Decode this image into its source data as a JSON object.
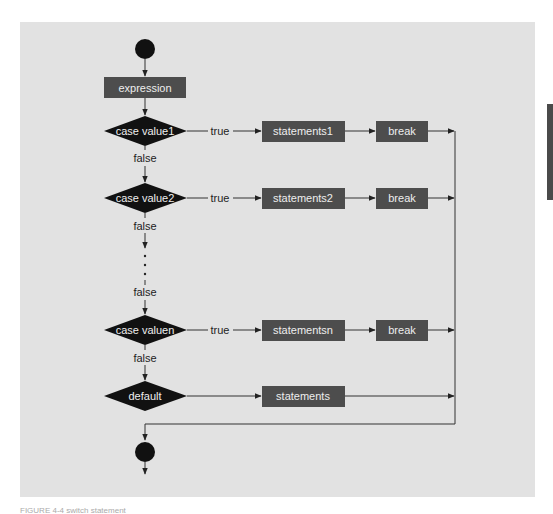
{
  "colors": {
    "panel_bg": "#e2e2e2",
    "box_fill": "#4d4d4d",
    "diamond_fill": "#111111",
    "line": "#333333",
    "box_text": "#eeeeee"
  },
  "diagram": {
    "start_node": "start-circle",
    "expression": "expression",
    "cases": [
      {
        "condition": "case value1",
        "true_label": "true",
        "statements": "statements1",
        "break": "break",
        "false_label": "false"
      },
      {
        "condition": "case value2",
        "true_label": "true",
        "statements": "statements2",
        "break": "break",
        "false_label": "false"
      },
      {
        "condition": "case valuen",
        "true_label": "true",
        "statements": "statementsn",
        "break": "break",
        "false_label": "false"
      }
    ],
    "ellipsis_false_label": "false",
    "default": {
      "condition": "default",
      "statements": "statements"
    },
    "end_node": "end-circle"
  },
  "caption": {
    "text": "FIGURE 4-4 switch statement"
  }
}
